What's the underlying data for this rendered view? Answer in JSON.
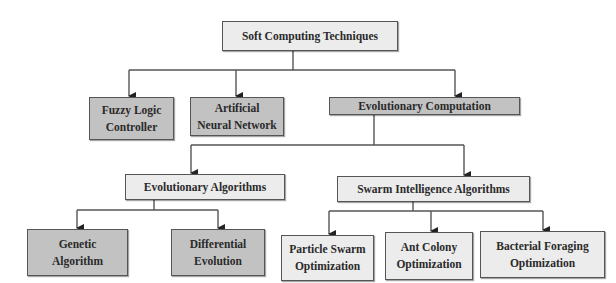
{
  "diagram": {
    "root": {
      "label": "Soft Computing Techniques"
    },
    "level1": [
      {
        "label": "Fuzzy Logic\nController"
      },
      {
        "label": "Artificial\nNeural Network"
      },
      {
        "label": "Evolutionary Computation"
      }
    ],
    "level2": [
      {
        "label": "Evolutionary Algorithms"
      },
      {
        "label": "Swarm Intelligence Algorithms"
      }
    ],
    "level3_ea": [
      {
        "label": "Genetic\nAlgorithm"
      },
      {
        "label": "Differential\nEvolution"
      }
    ],
    "level3_sia": [
      {
        "label": "Particle Swarm\nOptimization"
      },
      {
        "label": "Ant Colony\nOptimization"
      },
      {
        "label": "Bacterial Foraging\nOptimization"
      }
    ],
    "colors": {
      "dark_fill": "#c2c2c2",
      "light_fill": "#ececec",
      "line": "#444444"
    }
  }
}
